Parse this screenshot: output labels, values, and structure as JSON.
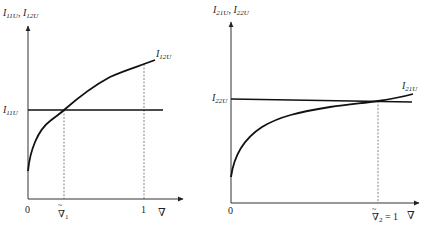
{
  "panels": [
    {
      "id": "left",
      "y_axis_label": {
        "main1": "I",
        "sub1": "11U",
        "sep": ", ",
        "main2": "I",
        "sub2": "12U"
      },
      "x_axis_symbol": "∇",
      "ticks": {
        "origin": "0",
        "intersection": "∇",
        "intersection_sub": "1",
        "intersection_tilde": "~",
        "one": "1"
      },
      "curves": [
        {
          "name": "I11U",
          "label_main": "I",
          "label_sub": "11U",
          "kind": "horizontal-line"
        },
        {
          "name": "I12U",
          "label_main": "I",
          "label_sub": "12U",
          "kind": "increasing-concave-curve"
        }
      ]
    },
    {
      "id": "right",
      "y_axis_label": {
        "main1": "I",
        "sub1": "21U",
        "sep": ", ",
        "main2": "I",
        "sub2": "22U"
      },
      "x_axis_symbol": "∇",
      "ticks": {
        "origin": "0",
        "intersection": "∇",
        "intersection_sub": "2",
        "intersection_tilde": "~",
        "intersection_eq": " = 1"
      },
      "curves": [
        {
          "name": "I22U",
          "label_main": "I",
          "label_sub": "22U",
          "kind": "horizontal-line"
        },
        {
          "name": "I21U",
          "label_main": "I",
          "label_sub": "21U",
          "kind": "increasing-concave-curve"
        }
      ]
    }
  ]
}
